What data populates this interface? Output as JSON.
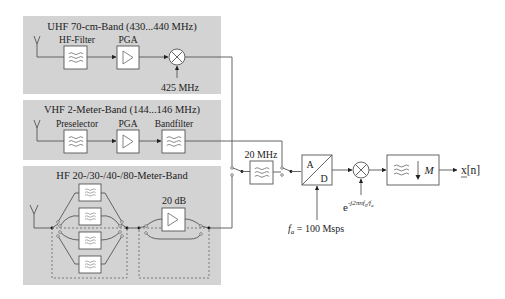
{
  "diagram": {
    "type": "block-diagram",
    "bands": {
      "uhf": {
        "title": "UHF 70-cm-Band (430...440 MHz)",
        "blocks": [
          "HF-Filter",
          "PGA"
        ],
        "lo_label": "425 MHz"
      },
      "vhf": {
        "title": "VHF 2-Meter-Band (144...146 MHz)",
        "blocks": [
          "Preselector",
          "PGA",
          "Bandfilter"
        ]
      },
      "hf": {
        "title": "HF 20-/30-/40-/80-Meter-Band",
        "filter_count": 4,
        "amp_label": "20 dB"
      }
    },
    "common_chain": {
      "filter_label": "20 MHz",
      "adc_a": "A",
      "adc_d": "D",
      "sample_rate_label_var": "f",
      "sample_rate_label_sub": "a",
      "sample_rate_label_value": " = 100 Msps",
      "mixer_label_base": "e",
      "mixer_label_exp": "-j2πnf",
      "mixer_label_exp_sub": "0",
      "mixer_label_exp_tail": "/f",
      "mixer_label_exp_tail_sub": "a",
      "decimator_label": "M",
      "output_label": "x[n]"
    }
  }
}
